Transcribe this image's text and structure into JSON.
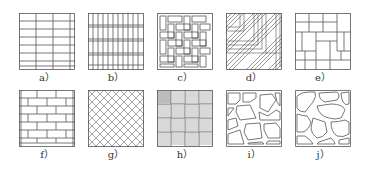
{
  "figure": {
    "stroke_color": "#555555",
    "panels": [
      {
        "id": "a",
        "label": "a）",
        "pattern": "stacked-bond-horizontal-rectangles"
      },
      {
        "id": "b",
        "label": "b）",
        "pattern": "stacked-narrow-vertical-rectangles"
      },
      {
        "id": "c",
        "label": "c）",
        "pattern": "basketweave-herringbone-rectangles"
      },
      {
        "id": "d",
        "label": "d）",
        "pattern": "diagonal-herringbone-parquet"
      },
      {
        "id": "e",
        "label": "e）",
        "pattern": "pinwheel-mixed-rectangles"
      },
      {
        "id": "f",
        "label": "f）",
        "pattern": "running-bond-brick"
      },
      {
        "id": "g",
        "label": "g）",
        "pattern": "diagonal-lattice-diamond"
      },
      {
        "id": "h",
        "label": "h）",
        "pattern": "parquet-basketweave-striped"
      },
      {
        "id": "i",
        "label": "i）",
        "pattern": "irregular-flagstone"
      },
      {
        "id": "j",
        "label": "j）",
        "pattern": "rounded-cobblestone"
      }
    ]
  }
}
